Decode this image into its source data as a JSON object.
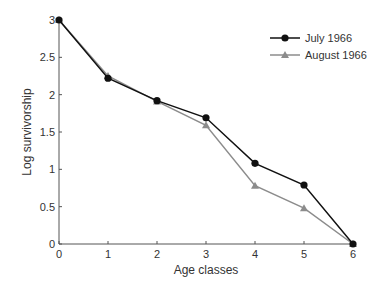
{
  "chart_data": {
    "type": "line",
    "title": "",
    "xlabel": "Age classes",
    "ylabel": "Log survivorship",
    "x": [
      0,
      1,
      2,
      3,
      4,
      5,
      6
    ],
    "xticks": [
      "0",
      "1",
      "2",
      "3",
      "4",
      "5",
      "6"
    ],
    "yticks": [
      "0",
      "0.5",
      "1",
      "1.5",
      "2",
      "2.5",
      "3"
    ],
    "xlim": [
      0,
      6
    ],
    "ylim": [
      0,
      3
    ],
    "grid": false,
    "legend_position": "upper right",
    "series": [
      {
        "name": "July 1966",
        "marker": "circle",
        "color": "#111111",
        "values": [
          3.0,
          2.22,
          1.92,
          1.69,
          1.08,
          0.79,
          0.0
        ]
      },
      {
        "name": "August 1966",
        "marker": "triangle",
        "color": "#8c8c8c",
        "values": [
          3.0,
          2.25,
          1.91,
          1.59,
          0.78,
          0.48,
          0.0
        ]
      }
    ]
  }
}
